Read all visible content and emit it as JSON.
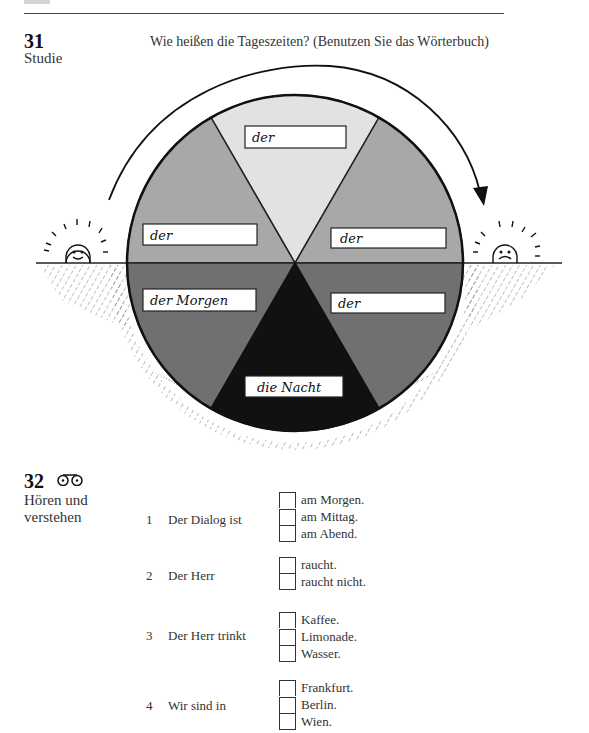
{
  "header": {
    "tab_color": "#d4d4d4"
  },
  "exercise31": {
    "number": "31",
    "subtitle": "Studie",
    "instruction": "Wie heißen die Tageszeiten? (Benutzen Sie das Wörterbuch)",
    "diagram": {
      "sectors": [
        {
          "position": "top",
          "label": "der",
          "color": "#e2e2e2"
        },
        {
          "position": "upper-left",
          "label": "der",
          "color": "#a8a8a8"
        },
        {
          "position": "upper-right",
          "label": "der",
          "color": "#a8a8a8"
        },
        {
          "position": "lower-left",
          "label": "der Morgen",
          "color": "#707070"
        },
        {
          "position": "lower-right",
          "label": "der",
          "color": "#707070"
        },
        {
          "position": "bottom",
          "label": "die Nacht",
          "color": "#111111"
        }
      ],
      "left_sun": "smiling-sun",
      "right_sun": "sad-sun"
    }
  },
  "exercise32": {
    "number": "32",
    "icon": "cassette-icon",
    "subtitle_line1": "Hören und",
    "subtitle_line2": "verstehen",
    "questions": [
      {
        "num": "1",
        "text": "Der Dialog ist",
        "options": [
          "am Morgen.",
          "am Mittag.",
          "am Abend."
        ]
      },
      {
        "num": "2",
        "text": "Der Herr",
        "options": [
          "raucht.",
          "raucht nicht."
        ]
      },
      {
        "num": "3",
        "text": "Der Herr trinkt",
        "options": [
          "Kaffee.",
          "Limonade.",
          "Wasser."
        ]
      },
      {
        "num": "4",
        "text": "Wir sind in",
        "options": [
          "Frankfurt.",
          "Berlin.",
          "Wien."
        ]
      }
    ]
  }
}
